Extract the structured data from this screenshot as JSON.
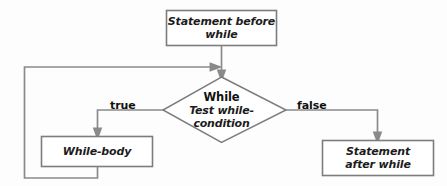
{
  "diagram": {
    "colors": {
      "line": "#8a8a8a",
      "box_border": "#7d7d7d",
      "box_fill": "#ffffff",
      "text": "#1c1c1c",
      "background": "#fdfdfd"
    },
    "nodes": {
      "statement_before": {
        "label_line1": "Statement before",
        "label_line2": "while",
        "shape": "rectangle"
      },
      "while_test": {
        "title": "While",
        "sub_line1": "Test while-",
        "sub_line2": "condition",
        "shape": "diamond"
      },
      "while_body": {
        "label": "While-body",
        "shape": "rectangle"
      },
      "statement_after": {
        "label_line1": "Statement",
        "label_line2": "after while",
        "shape": "rectangle"
      }
    },
    "edges": {
      "true_branch": "true",
      "false_branch": "false",
      "loop_back": ""
    }
  }
}
